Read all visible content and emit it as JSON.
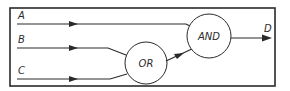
{
  "diagram": {
    "type": "logic-circuit",
    "inputs": [
      {
        "id": "A",
        "label": "A"
      },
      {
        "id": "B",
        "label": "B"
      },
      {
        "id": "C",
        "label": "C"
      }
    ],
    "gates": [
      {
        "id": "or",
        "label": "OR",
        "inputs": [
          "B",
          "C"
        ]
      },
      {
        "id": "and",
        "label": "AND",
        "inputs": [
          "A",
          "or"
        ]
      }
    ],
    "output": {
      "id": "D",
      "label": "D",
      "source": "and"
    },
    "colors": {
      "line": "#2a2a2a",
      "background": "#ffffff"
    }
  }
}
